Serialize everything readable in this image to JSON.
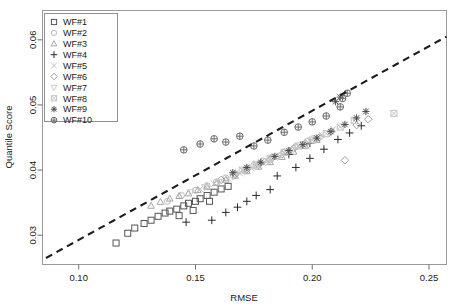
{
  "chart_data": {
    "type": "scatter",
    "title": "",
    "xlabel": "RMSE",
    "ylabel": "Quantile Score",
    "xlim": [
      0.0845,
      0.2575
    ],
    "ylim": [
      0.0255,
      0.0645
    ],
    "xticks": [
      0.1,
      0.15,
      0.2,
      0.25
    ],
    "xticklabels": [
      "0.10",
      "0.15",
      "0.20",
      "0.25"
    ],
    "yticks": [
      0.03,
      0.04,
      0.05,
      0.06
    ],
    "yticklabels": [
      "0.03",
      "0.04",
      "0.05",
      "0.06"
    ],
    "grid": false,
    "legend_position": "top-left",
    "reference_line": {
      "style": "dashed",
      "color": "#1c1c1c",
      "x": [
        0.086,
        0.2575
      ],
      "y": [
        0.0265,
        0.0605
      ]
    },
    "series": [
      {
        "name": "WF#1",
        "marker": "square",
        "color": "#555555",
        "points": [
          [
            0.116,
            0.0288
          ],
          [
            0.121,
            0.0303
          ],
          [
            0.124,
            0.0311
          ],
          [
            0.128,
            0.0318
          ],
          [
            0.131,
            0.0323
          ],
          [
            0.134,
            0.0329
          ],
          [
            0.137,
            0.0334
          ],
          [
            0.139,
            0.0337
          ],
          [
            0.142,
            0.034
          ],
          [
            0.145,
            0.0345
          ],
          [
            0.147,
            0.0349
          ],
          [
            0.15,
            0.0352
          ],
          [
            0.152,
            0.0356
          ],
          [
            0.155,
            0.0361
          ],
          [
            0.158,
            0.0366
          ],
          [
            0.161,
            0.0371
          ],
          [
            0.164,
            0.0375
          ],
          [
            0.143,
            0.033
          ],
          [
            0.149,
            0.0338
          ],
          [
            0.156,
            0.0352
          ]
        ]
      },
      {
        "name": "WF#2",
        "marker": "circle",
        "color": "#b9b9b9",
        "points": [
          [
            0.138,
            0.0352
          ],
          [
            0.144,
            0.0361
          ],
          [
            0.15,
            0.0369
          ],
          [
            0.155,
            0.0376
          ],
          [
            0.159,
            0.0382
          ],
          [
            0.163,
            0.0388
          ],
          [
            0.167,
            0.0394
          ],
          [
            0.171,
            0.04
          ],
          [
            0.175,
            0.0407
          ],
          [
            0.179,
            0.0414
          ],
          [
            0.183,
            0.042
          ],
          [
            0.188,
            0.0428
          ],
          [
            0.193,
            0.0436
          ],
          [
            0.198,
            0.0444
          ]
        ]
      },
      {
        "name": "WF#3",
        "marker": "triangle",
        "color": "#a5a5a5",
        "points": [
          [
            0.131,
            0.0345
          ],
          [
            0.135,
            0.0351
          ],
          [
            0.139,
            0.0356
          ],
          [
            0.143,
            0.036
          ],
          [
            0.147,
            0.0364
          ],
          [
            0.151,
            0.0369
          ],
          [
            0.155,
            0.0374
          ],
          [
            0.159,
            0.038
          ],
          [
            0.163,
            0.0385
          ],
          [
            0.167,
            0.0391
          ],
          [
            0.172,
            0.0398
          ],
          [
            0.177,
            0.0405
          ],
          [
            0.182,
            0.0412
          ],
          [
            0.187,
            0.042
          ],
          [
            0.192,
            0.0428
          ],
          [
            0.197,
            0.0437
          ],
          [
            0.202,
            0.0446
          ]
        ]
      },
      {
        "name": "WF#4",
        "marker": "plus",
        "color": "#2a2a2a",
        "points": [
          [
            0.146,
            0.032
          ],
          [
            0.157,
            0.0323
          ],
          [
            0.163,
            0.0335
          ],
          [
            0.168,
            0.0343
          ],
          [
            0.172,
            0.0352
          ],
          [
            0.176,
            0.0361
          ],
          [
            0.182,
            0.037
          ],
          [
            0.185,
            0.0391
          ],
          [
            0.193,
            0.0404
          ],
          [
            0.199,
            0.0418
          ],
          [
            0.205,
            0.0432
          ],
          [
            0.211,
            0.0447
          ],
          [
            0.216,
            0.0457
          ],
          [
            0.221,
            0.0468
          ],
          [
            0.199,
            0.0441
          ],
          [
            0.19,
            0.0424
          ]
        ]
      },
      {
        "name": "WF#5",
        "marker": "cross",
        "color": "#bdbdbd",
        "points": [
          [
            0.152,
            0.0371
          ],
          [
            0.158,
            0.0379
          ],
          [
            0.164,
            0.0387
          ],
          [
            0.169,
            0.0395
          ],
          [
            0.174,
            0.0403
          ],
          [
            0.179,
            0.0411
          ],
          [
            0.184,
            0.0419
          ],
          [
            0.189,
            0.0427
          ],
          [
            0.194,
            0.0436
          ],
          [
            0.199,
            0.0445
          ],
          [
            0.204,
            0.0454
          ],
          [
            0.209,
            0.0463
          ]
        ]
      },
      {
        "name": "WF#6",
        "marker": "diamond",
        "color": "#9e9e9e",
        "points": [
          [
            0.161,
            0.0385
          ],
          [
            0.167,
            0.0393
          ],
          [
            0.172,
            0.0401
          ],
          [
            0.177,
            0.0408
          ],
          [
            0.182,
            0.0416
          ],
          [
            0.187,
            0.0424
          ],
          [
            0.192,
            0.0433
          ],
          [
            0.197,
            0.0441
          ],
          [
            0.203,
            0.045
          ],
          [
            0.208,
            0.0459
          ],
          [
            0.214,
            0.0415
          ],
          [
            0.219,
            0.0469
          ],
          [
            0.224,
            0.0478
          ]
        ]
      },
      {
        "name": "WF#7",
        "marker": "triangle-down",
        "color": "#cccccc",
        "points": [
          [
            0.148,
            0.0366
          ],
          [
            0.154,
            0.0374
          ],
          [
            0.16,
            0.0382
          ],
          [
            0.166,
            0.039
          ],
          [
            0.171,
            0.0398
          ],
          [
            0.176,
            0.0406
          ],
          [
            0.181,
            0.0414
          ],
          [
            0.186,
            0.0422
          ],
          [
            0.191,
            0.0431
          ],
          [
            0.196,
            0.044
          ],
          [
            0.201,
            0.0449
          ]
        ]
      },
      {
        "name": "WF#8",
        "marker": "square-cross",
        "color": "#c4c4c4",
        "points": [
          [
            0.17,
            0.04
          ],
          [
            0.176,
            0.0409
          ],
          [
            0.182,
            0.0418
          ],
          [
            0.188,
            0.0427
          ],
          [
            0.194,
            0.0437
          ],
          [
            0.2,
            0.0446
          ],
          [
            0.206,
            0.0456
          ],
          [
            0.212,
            0.0466
          ],
          [
            0.218,
            0.0476
          ],
          [
            0.235,
            0.0487
          ]
        ]
      },
      {
        "name": "WF#9",
        "marker": "asterisk",
        "color": "#4a4a4a",
        "points": [
          [
            0.166,
            0.0396
          ],
          [
            0.172,
            0.0404
          ],
          [
            0.178,
            0.0412
          ],
          [
            0.184,
            0.0421
          ],
          [
            0.19,
            0.043
          ],
          [
            0.196,
            0.0439
          ],
          [
            0.202,
            0.0449
          ],
          [
            0.208,
            0.0459
          ],
          [
            0.214,
            0.047
          ],
          [
            0.219,
            0.048
          ],
          [
            0.223,
            0.049
          ],
          [
            0.21,
            0.0505
          ],
          [
            0.212,
            0.0512
          ]
        ]
      },
      {
        "name": "WF#10",
        "marker": "circle-plus",
        "color": "#6b6b6b",
        "points": [
          [
            0.158,
            0.0448
          ],
          [
            0.163,
            0.0443
          ],
          [
            0.169,
            0.0452
          ],
          [
            0.175,
            0.0437
          ],
          [
            0.181,
            0.0446
          ],
          [
            0.188,
            0.0458
          ],
          [
            0.194,
            0.0466
          ],
          [
            0.2,
            0.0474
          ],
          [
            0.206,
            0.0483
          ],
          [
            0.212,
            0.0497
          ],
          [
            0.213,
            0.051
          ],
          [
            0.215,
            0.0518
          ],
          [
            0.145,
            0.0431
          ],
          [
            0.152,
            0.044
          ]
        ]
      }
    ]
  },
  "legend": {
    "items": [
      {
        "label": "WF#1"
      },
      {
        "label": "WF#2"
      },
      {
        "label": "WF#3"
      },
      {
        "label": "WF#4"
      },
      {
        "label": "WF#5"
      },
      {
        "label": "WF#6"
      },
      {
        "label": "WF#7"
      },
      {
        "label": "WF#8"
      },
      {
        "label": "WF#9"
      },
      {
        "label": "WF#10"
      }
    ]
  }
}
